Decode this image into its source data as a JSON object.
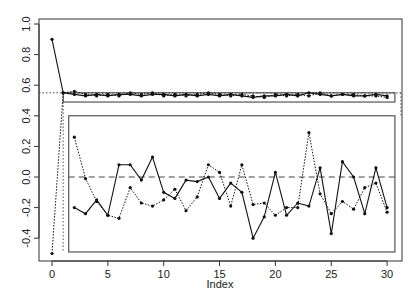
{
  "chart_data": {
    "type": "line",
    "title": "",
    "xlabel": "Index",
    "ylabel": "",
    "xlim": [
      0,
      30
    ],
    "ylim": [
      -0.5,
      1.0
    ],
    "grid": false,
    "legend": null,
    "x_ticks": [
      0,
      5,
      10,
      15,
      20,
      25,
      30
    ],
    "y_ticks": [
      -0.4,
      -0.2,
      0.0,
      0.2,
      0.4,
      0.6,
      0.8,
      1.0
    ],
    "x_tick_labels": [
      "0",
      "5",
      "10",
      "15",
      "20",
      "25",
      "30"
    ],
    "y_tick_labels": [
      "-0.4",
      "-0.2",
      "0.0",
      "0.2",
      "0.4",
      "0.6",
      "0.8",
      "1.0"
    ],
    "reference_lines": [
      {
        "orientation": "horizontal",
        "y": 0.55,
        "style": "dotted",
        "span": "full"
      },
      {
        "orientation": "horizontal",
        "y": 0.0,
        "style": "dashed",
        "span": "lower-box"
      }
    ],
    "boxes": [
      {
        "name": "upper-band-box",
        "x_range": [
          1.0,
          30.7
        ],
        "y_range": [
          0.49,
          0.55
        ]
      },
      {
        "name": "lower-box",
        "x_range": [
          1.5,
          30.7
        ],
        "y_range": [
          -0.49,
          0.4
        ]
      }
    ],
    "series": [
      {
        "name": "solid-upper",
        "style": "solid",
        "x": [
          0,
          1,
          2,
          3,
          4,
          5,
          6,
          7,
          8,
          9,
          10,
          11,
          12,
          13,
          14,
          15,
          16,
          17,
          18,
          19,
          20,
          21,
          22,
          23,
          24,
          25,
          26,
          27,
          28,
          29,
          30
        ],
        "values": [
          0.9,
          0.55,
          0.54,
          0.53,
          0.54,
          0.53,
          0.54,
          0.54,
          0.53,
          0.54,
          0.54,
          0.53,
          0.54,
          0.53,
          0.54,
          0.53,
          0.54,
          0.53,
          0.52,
          0.53,
          0.53,
          0.54,
          0.53,
          0.55,
          0.54,
          0.53,
          0.54,
          0.53,
          0.53,
          0.54,
          0.53
        ]
      },
      {
        "name": "dotted-upper",
        "style": "dotted",
        "x": [
          0,
          1,
          2,
          3,
          4,
          5,
          6,
          7,
          8,
          9,
          10,
          11,
          12,
          13,
          14,
          15,
          16,
          17,
          18,
          19,
          20,
          21,
          22,
          23,
          24,
          25,
          26,
          27,
          28,
          29,
          30
        ],
        "values": [
          -0.5,
          0.55,
          0.56,
          0.54,
          0.53,
          0.54,
          0.53,
          0.55,
          0.54,
          0.55,
          0.53,
          0.54,
          0.53,
          0.54,
          0.55,
          0.54,
          0.53,
          0.54,
          0.53,
          0.52,
          0.54,
          0.53,
          0.54,
          0.53,
          0.55,
          0.53,
          0.54,
          0.54,
          0.53,
          0.53,
          0.52
        ]
      },
      {
        "name": "solid-lower",
        "style": "solid",
        "x": [
          2,
          3,
          4,
          5,
          6,
          7,
          8,
          9,
          10,
          11,
          12,
          13,
          14,
          15,
          16,
          17,
          18,
          19,
          20,
          21,
          22,
          23,
          24,
          25,
          26,
          27,
          28,
          29,
          30
        ],
        "values": [
          -0.2,
          -0.24,
          -0.15,
          -0.25,
          0.08,
          0.08,
          -0.02,
          0.13,
          -0.1,
          -0.14,
          -0.02,
          -0.03,
          0.0,
          -0.14,
          -0.04,
          -0.1,
          -0.4,
          -0.26,
          0.03,
          -0.25,
          -0.17,
          -0.19,
          0.06,
          -0.37,
          0.1,
          0.0,
          -0.24,
          0.06,
          -0.2
        ]
      },
      {
        "name": "dotted-lower",
        "style": "dotted",
        "x": [
          2,
          3,
          4,
          5,
          6,
          7,
          8,
          9,
          10,
          11,
          12,
          13,
          14,
          15,
          16,
          17,
          18,
          19,
          20,
          21,
          22,
          23,
          24,
          25,
          26,
          27,
          28,
          29,
          30
        ],
        "values": [
          0.26,
          -0.01,
          -0.16,
          -0.25,
          -0.27,
          -0.07,
          -0.17,
          -0.19,
          -0.15,
          -0.08,
          -0.22,
          -0.13,
          0.08,
          0.03,
          -0.19,
          0.08,
          -0.18,
          -0.17,
          -0.25,
          -0.2,
          -0.2,
          0.29,
          -0.11,
          -0.24,
          -0.16,
          -0.21,
          -0.07,
          -0.04,
          -0.23
        ]
      }
    ]
  }
}
